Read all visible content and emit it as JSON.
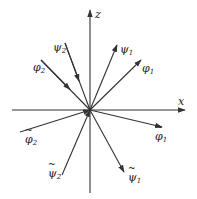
{
  "axes": {
    "z": {
      "label": "z"
    },
    "x": {
      "label": "x"
    }
  },
  "vectors": [
    {
      "id": "phi2",
      "symbol": "φ",
      "sub": "2",
      "tilde": false,
      "direction": "incoming"
    },
    {
      "id": "psi2",
      "symbol": "ψ",
      "sub": "2",
      "tilde": false,
      "direction": "incoming"
    },
    {
      "id": "psi1",
      "symbol": "ψ",
      "sub": "1",
      "tilde": false,
      "direction": "outgoing"
    },
    {
      "id": "phi1",
      "symbol": "φ",
      "sub": "1",
      "tilde": false,
      "direction": "outgoing"
    },
    {
      "id": "phi2t",
      "symbol": "φ",
      "sub": "2",
      "tilde": true,
      "direction": "incoming"
    },
    {
      "id": "psi2t",
      "symbol": "ψ",
      "sub": "2",
      "tilde": true,
      "direction": "incoming"
    },
    {
      "id": "phi1t",
      "symbol": "φ",
      "sub": "1",
      "tilde": true,
      "direction": "outgoing"
    },
    {
      "id": "psi1t",
      "symbol": "ψ",
      "sub": "1",
      "tilde": true,
      "direction": "outgoing"
    }
  ],
  "colors": {
    "line": "#333333",
    "background": "#ffffff"
  }
}
